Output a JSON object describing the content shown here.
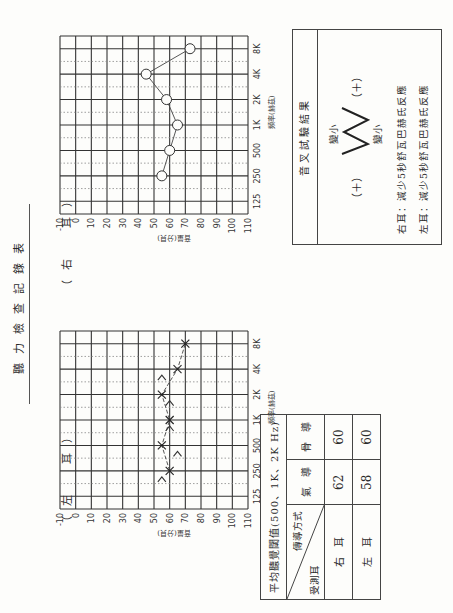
{
  "document": {
    "title": "聽力檢查記錄表",
    "right_ear_label": "（右　耳）",
    "left_ear_label": "（左　耳）"
  },
  "axes": {
    "y_label": "音量(分貝)",
    "x_label": "頻率(赫茲)",
    "db_ticks": [
      "-10",
      "0",
      "10",
      "20",
      "30",
      "40",
      "50",
      "60",
      "70",
      "80",
      "90",
      "100",
      "110"
    ],
    "freq_ticks": [
      "125",
      "250",
      "500",
      "1K",
      "2K",
      "4K",
      "8K"
    ]
  },
  "chart_data": [
    {
      "type": "line",
      "title": "右耳 聽力圖",
      "xlabel": "頻率(赫茲)",
      "ylabel": "音量(分貝)",
      "categories": [
        "125",
        "250",
        "500",
        "1K",
        "2K",
        "4K",
        "8K"
      ],
      "ylim": [
        -10,
        110
      ],
      "y_inverted": true,
      "grid": true,
      "series": [
        {
          "name": "右耳 氣導 (O)",
          "marker": "circle",
          "values": [
            null,
            55,
            60,
            65,
            58,
            45,
            73
          ]
        }
      ]
    },
    {
      "type": "line",
      "title": "左耳 聽力圖",
      "xlabel": "頻率(赫茲)",
      "ylabel": "音量(分貝)",
      "categories": [
        "125",
        "250",
        "500",
        "1K",
        "2K",
        "4K",
        "8K"
      ],
      "ylim": [
        -10,
        110
      ],
      "y_inverted": true,
      "grid": true,
      "series": [
        {
          "name": "左耳 氣導 (X)",
          "marker": "x",
          "values": [
            null,
            60,
            55,
            60,
            55,
            65,
            70
          ]
        },
        {
          "name": "左耳 骨導 (>)",
          "marker": "gt",
          "values": [
            null,
            55,
            65,
            60,
            60,
            55,
            null
          ]
        }
      ]
    }
  ],
  "average_table": {
    "title": "平均聽覺閾值(500、1K、2K Hz)",
    "diag_top": "傳導方式",
    "diag_bottom": "受測耳",
    "col_air": "氣　導",
    "col_bone": "骨　導",
    "rows": [
      {
        "ear": "右　耳",
        "air": "62",
        "bone": "60"
      },
      {
        "ear": "左　耳",
        "air": "58",
        "bone": "60"
      }
    ]
  },
  "tuning_fork": {
    "title": "音叉試驗結果",
    "smaller_top": "變小",
    "smaller_bottom": "變小",
    "plus_left": "（＋）",
    "plus_right": "（＋）",
    "right_ear_result": "右耳：減少5秒舒瓦巴赫氏反應",
    "left_ear_result": "左耳：減少5秒舒瓦巴赫氏反應"
  }
}
